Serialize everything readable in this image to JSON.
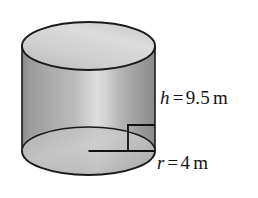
{
  "figure": {
    "name": "cylinder-diagram",
    "shape": "cylinder",
    "background_color": "#ffffff",
    "outline_color": "#1a1a1a",
    "fill_light": "#d8d8d8",
    "fill_mid": "#b4b4b4",
    "fill_dark": "#8f8f8f",
    "text_color": "#141414"
  },
  "labels": {
    "height": {
      "variable": "h",
      "equals": "=",
      "value": "9.5",
      "unit": "m",
      "full_text": "h = 9.5 m"
    },
    "radius": {
      "variable": "r",
      "equals": "=",
      "value": "4",
      "unit": "m",
      "full_text": "r = 4 m"
    }
  },
  "geometry": {
    "top_ellipse": {
      "cx": 88.5,
      "cy": 46,
      "rx": 66.5,
      "ry": 24
    },
    "bottom_ellipse": {
      "cx": 88.5,
      "cy": 151,
      "rx": 66.5,
      "ry": 24
    },
    "body_top_y": 46,
    "body_bottom_y": 151,
    "radius_line": {
      "x1": 88.5,
      "y1": 151,
      "x2": 155,
      "y2": 151
    },
    "height_line": {
      "x1": 128,
      "y1": 125,
      "x2": 128,
      "y2": 151
    },
    "right_angle_marker": {
      "x": 128,
      "y": 125,
      "size": 27
    }
  },
  "measurements": {
    "height_value": 9.5,
    "radius_value": 4,
    "unit": "m"
  }
}
